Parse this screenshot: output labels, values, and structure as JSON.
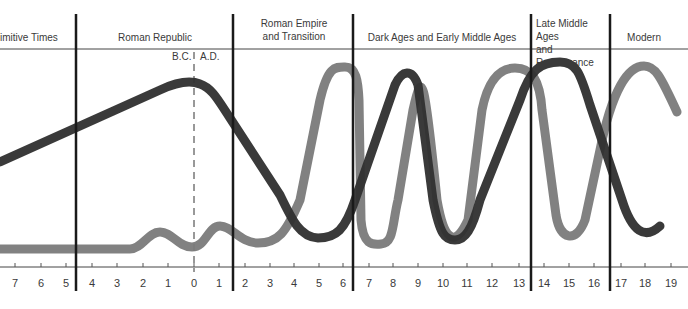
{
  "chart_data": {
    "type": "line",
    "title": "",
    "xlabel": "Century (B.C. / A.D.)",
    "ylabel": "",
    "grid": false,
    "legend": null,
    "eras": [
      {
        "label": "Primitive Times",
        "display": "imitive Times",
        "x_range": [
          "7 B.C.",
          "4.5 B.C."
        ]
      },
      {
        "label": "Roman Republic",
        "x_range": [
          "4.5 B.C.",
          "1.5 A.D."
        ]
      },
      {
        "label": "Roman Empire and Transition",
        "x_range": [
          "1.5 A.D.",
          "6.5 A.D."
        ]
      },
      {
        "label": "Dark Ages and Early Middle Ages",
        "x_range": [
          "6.5 A.D.",
          "13.5 A.D."
        ]
      },
      {
        "label": "Late Middle Ages and Renaissance",
        "x_range": [
          "13.5 A.D.",
          "16.5 A.D."
        ]
      },
      {
        "label": "Modern",
        "x_range": [
          "16.5 A.D.",
          "19 A.D."
        ]
      }
    ],
    "era_markers": {
      "bc": "B.C.",
      "ad": "A.D."
    },
    "tick_labels": [
      "7",
      "6",
      "5",
      "4",
      "3",
      "2",
      "1",
      "0",
      "1",
      "2",
      "3",
      "4",
      "5",
      "6",
      "7",
      "8",
      "9",
      "10",
      "11",
      "12",
      "13",
      "14",
      "15",
      "16",
      "17",
      "18",
      "19"
    ],
    "x": [
      -7,
      -6,
      -5,
      -4,
      -3,
      -2,
      -1,
      0,
      1,
      2,
      3,
      4,
      5,
      6,
      7,
      8,
      9,
      10,
      11,
      12,
      13,
      14,
      15,
      16,
      17,
      18,
      19
    ],
    "ylim": [
      0,
      100
    ],
    "series": [
      {
        "name": "Dark curve",
        "color": "#2f2f2f",
        "values": [
          36,
          43,
          50,
          57,
          64,
          71,
          78,
          82,
          72,
          52,
          30,
          14,
          10,
          20,
          55,
          90,
          62,
          18,
          10,
          48,
          88,
          95,
          65,
          28,
          12,
          null,
          null
        ]
      },
      {
        "name": "Gray curve",
        "color": "#7a7a7a",
        "values": [
          6,
          6,
          6,
          6,
          6,
          6,
          12,
          8,
          14,
          8,
          10,
          30,
          90,
          90,
          18,
          30,
          90,
          30,
          60,
          92,
          90,
          28,
          12,
          48,
          90,
          80,
          null
        ]
      }
    ]
  },
  "colors": {
    "dark_curve": "#2f2f2f",
    "gray_curve": "#7a7a7a",
    "divider": "#1a1a1a",
    "text": "#3a3a3a"
  }
}
